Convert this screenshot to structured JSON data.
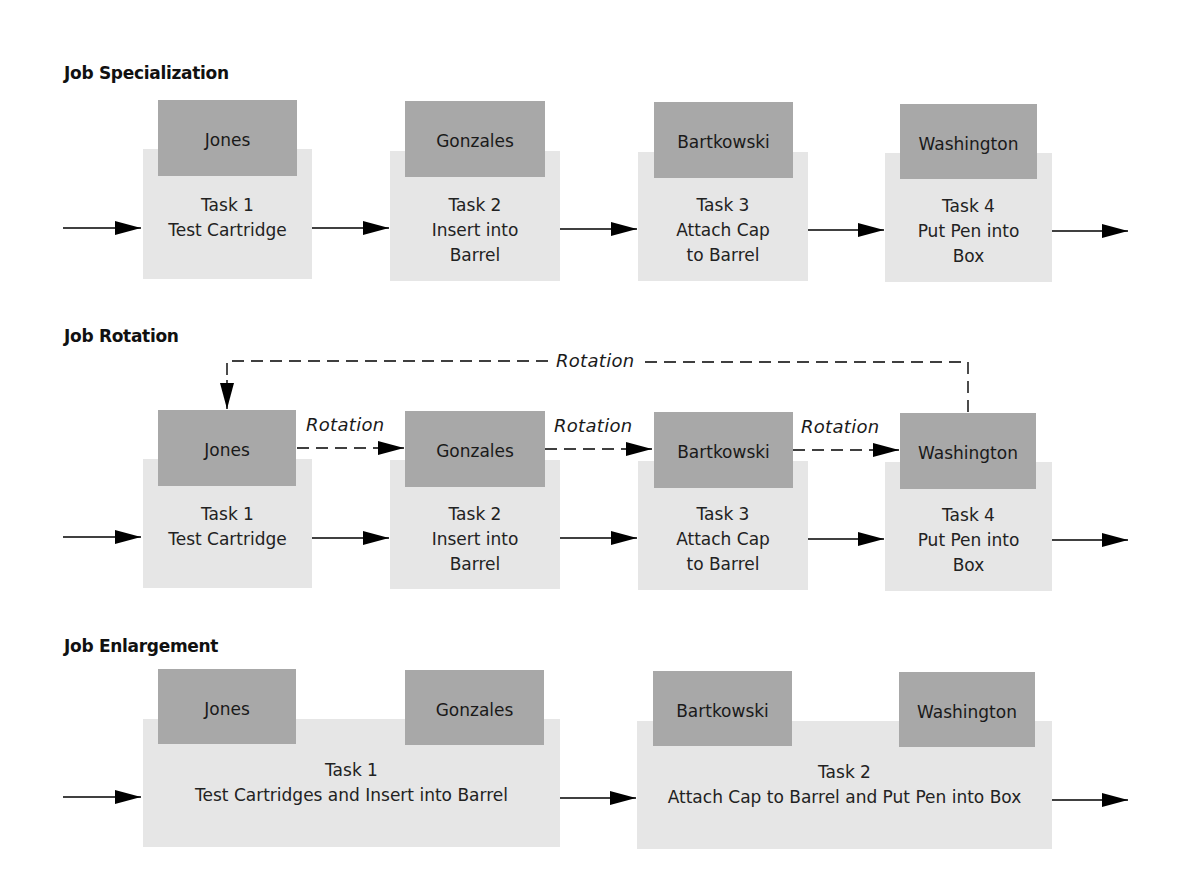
{
  "colors": {
    "task_box": "#e6e6e6",
    "worker_box": "#a8a8a8",
    "text": "#1a1a1a",
    "arrow": "#000000"
  },
  "specialization": {
    "title": "Job Specialization",
    "stations": [
      {
        "worker": "Jones",
        "task_number": "Task 1",
        "task_lines": [
          "Test Cartridge"
        ]
      },
      {
        "worker": "Gonzales",
        "task_number": "Task 2",
        "task_lines": [
          "Insert into",
          "Barrel"
        ]
      },
      {
        "worker": "Bartkowski",
        "task_number": "Task 3",
        "task_lines": [
          "Attach Cap",
          "to Barrel"
        ]
      },
      {
        "worker": "Washington",
        "task_number": "Task 4",
        "task_lines": [
          "Put Pen into",
          "Box"
        ]
      }
    ]
  },
  "rotation": {
    "title": "Job Rotation",
    "rotation_label": "Rotation",
    "return_label": "Rotation",
    "stations": [
      {
        "worker": "Jones",
        "task_number": "Task 1",
        "task_lines": [
          "Test Cartridge"
        ]
      },
      {
        "worker": "Gonzales",
        "task_number": "Task 2",
        "task_lines": [
          "Insert into",
          "Barrel"
        ]
      },
      {
        "worker": "Bartkowski",
        "task_number": "Task 3",
        "task_lines": [
          "Attach Cap",
          "to Barrel"
        ]
      },
      {
        "worker": "Washington",
        "task_number": "Task 4",
        "task_lines": [
          "Put Pen into",
          "Box"
        ]
      }
    ],
    "rotation_arrows": [
      {
        "label": "Rotation",
        "from": "Jones",
        "to": "Gonzales"
      },
      {
        "label": "Rotation",
        "from": "Gonzales",
        "to": "Bartkowski"
      },
      {
        "label": "Rotation",
        "from": "Bartkowski",
        "to": "Washington"
      },
      {
        "label": "Rotation",
        "from": "Washington",
        "to": "Jones"
      }
    ]
  },
  "enlargement": {
    "title": "Job Enlargement",
    "stations": [
      {
        "workers": [
          "Jones",
          "Gonzales"
        ],
        "task_number": "Task 1",
        "task_lines": [
          "Test Cartridges and Insert into Barrel"
        ]
      },
      {
        "workers": [
          "Bartkowski",
          "Washington"
        ],
        "task_number": "Task 2",
        "task_lines": [
          "Attach Cap to Barrel and Put Pen into Box"
        ]
      }
    ]
  }
}
